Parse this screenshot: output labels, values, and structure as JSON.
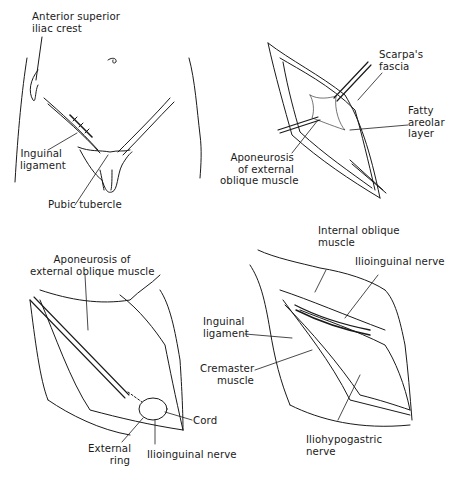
{
  "figure": {
    "panels": [
      {
        "id": "surface-anatomy",
        "labels": [
          {
            "lines": [
              "Anterior superior",
              "iliac crest"
            ]
          },
          {
            "lines": [
              "Inguinal",
              "ligament"
            ]
          },
          {
            "lines": [
              "Pubic tubercle"
            ]
          }
        ]
      },
      {
        "id": "skin-incision-layers",
        "labels": [
          {
            "lines": [
              "Scarpa's",
              "fascia"
            ]
          },
          {
            "lines": [
              "Fatty",
              "areolar",
              "layer"
            ]
          },
          {
            "lines": [
              "Aponeurosis",
              "of external",
              "oblique muscle"
            ]
          }
        ]
      },
      {
        "id": "external-oblique-exposed",
        "labels": [
          {
            "lines": [
              "Aponeurosis of",
              "external oblique muscle"
            ]
          },
          {
            "lines": [
              "Cord"
            ]
          },
          {
            "lines": [
              "External",
              "ring"
            ]
          },
          {
            "lines": [
              "Ilioinguinal nerve"
            ]
          }
        ]
      },
      {
        "id": "canal-opened",
        "labels": [
          {
            "lines": [
              "Internal oblique",
              "muscle"
            ]
          },
          {
            "lines": [
              "Ilioinguinal nerve"
            ]
          },
          {
            "lines": [
              "Inguinal",
              "ligament"
            ]
          },
          {
            "lines": [
              "Cremaster",
              "muscle"
            ]
          },
          {
            "lines": [
              "Iliohypogastric",
              "nerve"
            ]
          }
        ]
      }
    ]
  }
}
